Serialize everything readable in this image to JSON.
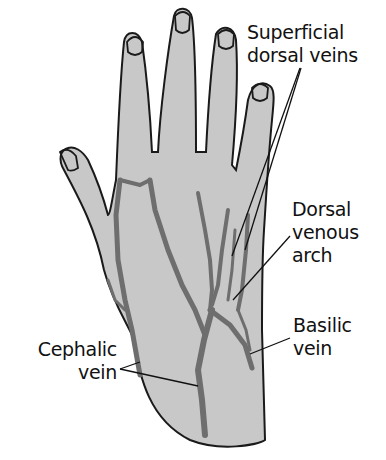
{
  "diagram": {
    "labels": {
      "superficial_dorsal_veins": {
        "line1": "Superficial",
        "line2": "dorsal veins"
      },
      "dorsal_venous_arch": {
        "line1": "Dorsal",
        "line2": "venous",
        "line3": "arch"
      },
      "basilic_vein": {
        "line1": "Basilic",
        "line2": "vein"
      },
      "cephalic_vein": {
        "line1": "Cephalic",
        "line2": "vein"
      }
    },
    "colors": {
      "background": "#ffffff",
      "skin_fill": "#c8c8c8",
      "outline": "#1a1a1a",
      "vein_fill": "#6e6e6e",
      "text": "#111111"
    }
  }
}
